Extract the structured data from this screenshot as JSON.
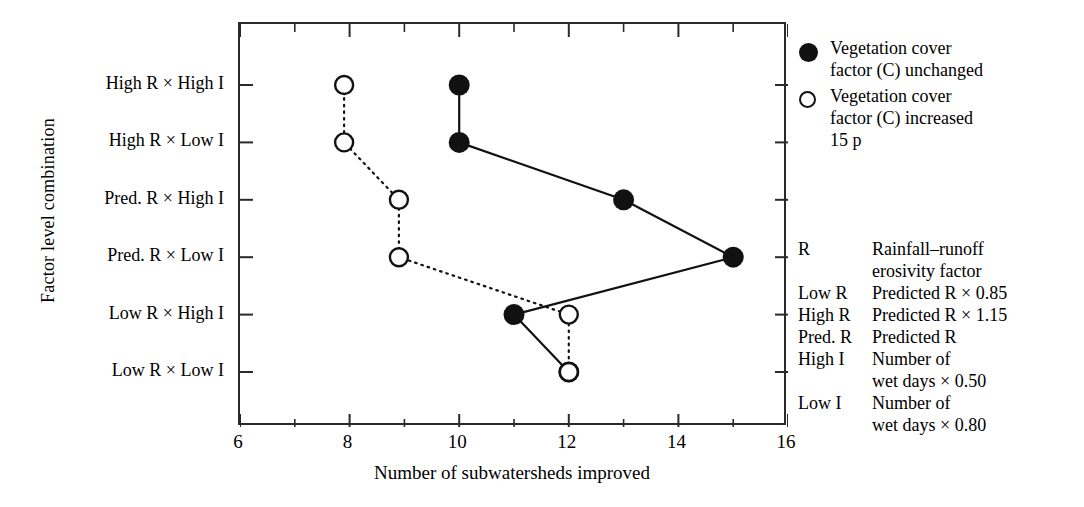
{
  "chart_data": {
    "type": "scatter",
    "orientation": "horizontal",
    "title": "",
    "xlabel": "Number of subwatersheds improved",
    "ylabel": "Factor level combination",
    "categories": [
      "High R × High I",
      "High R × Low I",
      "Pred. R × High I",
      "Pred. R × Low I",
      "Low R × High I",
      "Low R × Low I"
    ],
    "xlim": [
      6,
      16
    ],
    "xticks": [
      6,
      8,
      10,
      12,
      14,
      16
    ],
    "xticklabels": [
      "6",
      "8",
      "10",
      "12",
      "14",
      "16"
    ],
    "xminorticks": [
      7,
      9,
      11,
      13,
      15
    ],
    "grid": false,
    "frame": "box",
    "tick_direction": "in",
    "legend_position": "right-top",
    "series": [
      {
        "name": "Vegetation cover factor (C) unchanged",
        "marker": "filled-circle",
        "line": "solid",
        "values": [
          10,
          10,
          13,
          15,
          11,
          12
        ]
      },
      {
        "name": "Vegetation cover factor (C) increased 15 p",
        "marker": "open-circle",
        "line": "dotted",
        "values": [
          7.9,
          7.9,
          8.9,
          8.9,
          12,
          12
        ]
      }
    ]
  },
  "axes": {
    "ylabel": "Factor level combination",
    "xlabel": "Number of subwatersheds improved",
    "ytick_labels": [
      "High R × High I",
      "High R × Low I",
      "Pred. R × High I",
      "Pred. R × Low I",
      "Low R × High I",
      "Low R × Low I"
    ],
    "xtick_labels": [
      "6",
      "8",
      "10",
      "12",
      "14",
      "16"
    ]
  },
  "legend": {
    "items": [
      {
        "marker": "filled-circle",
        "line1": "Vegetation cover",
        "line2": "factor (C) unchanged",
        "line3": ""
      },
      {
        "marker": "open-circle",
        "line1": "Vegetation cover",
        "line2": "factor (C) increased",
        "line3": "15 p"
      }
    ]
  },
  "glossary": {
    "rows": [
      {
        "key": "R",
        "value": "Rainfall–runoff",
        "cont": "erosivity factor"
      },
      {
        "key": "Low R",
        "value": "Predicted R × 0.85",
        "cont": ""
      },
      {
        "key": "High R",
        "value": "Predicted R × 1.15",
        "cont": ""
      },
      {
        "key": "Pred. R",
        "value": "Predicted R",
        "cont": ""
      },
      {
        "key": "High I",
        "value": "Number of",
        "cont": "wet days × 0.50"
      },
      {
        "key": "Low I",
        "value": "Number of",
        "cont": "wet days × 0.80"
      }
    ]
  },
  "colors": {
    "ink": "#111111",
    "frame": "#2a2a2a",
    "background": "#ffffff"
  }
}
